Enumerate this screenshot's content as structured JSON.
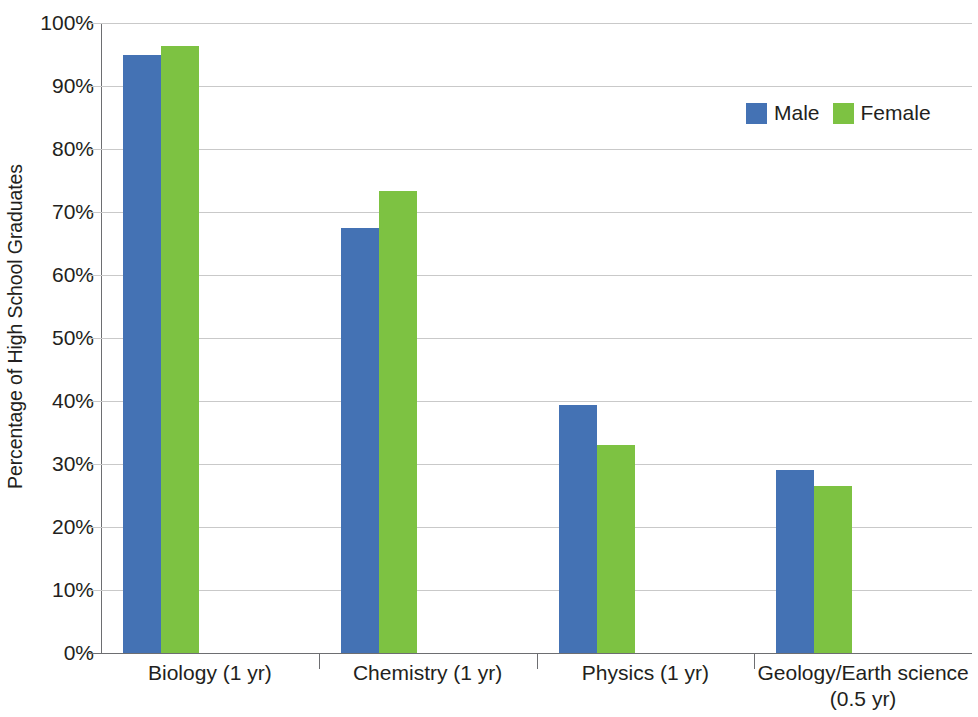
{
  "chart_data": {
    "type": "bar",
    "title": "",
    "subtitle": "",
    "xlabel": "",
    "ylabel": "Percentage of High School Graduates",
    "ylim": [
      0,
      100
    ],
    "ytick_values": [
      0,
      10,
      20,
      30,
      40,
      50,
      60,
      70,
      80,
      90,
      100
    ],
    "ytick_labels": [
      "0%",
      "10%",
      "20%",
      "30%",
      "40%",
      "50%",
      "60%",
      "70%",
      "80%",
      "90%",
      "100%"
    ],
    "grid": true,
    "legend_position": "top-right",
    "categories": [
      "Biology (1 yr)",
      "Chemistry (1 yr)",
      "Physics (1 yr)",
      "Geology/Earth science (0.5 yr)"
    ],
    "category_lines": [
      [
        "Biology (1 yr)"
      ],
      [
        "Chemistry (1 yr)"
      ],
      [
        "Physics (1 yr)"
      ],
      [
        "Geology/Earth science",
        "(0.5 yr)"
      ]
    ],
    "series": [
      {
        "name": "Male",
        "color": "#4472b4",
        "values": [
          95.0,
          67.5,
          39.3,
          29.0
        ],
        "value_labels": [
          "95%",
          "67.5%",
          "39.3%",
          "29%"
        ]
      },
      {
        "name": "Female",
        "color": "#7dc242",
        "values": [
          96.3,
          73.4,
          33.0,
          26.5
        ],
        "value_labels": [
          "96.3%",
          "73.4%",
          "33%",
          "26.5%"
        ]
      }
    ]
  },
  "legend": {
    "entries": [
      {
        "label": "Male",
        "color": "#4472b4",
        "swatch_name": "legend-swatch-male"
      },
      {
        "label": "Female",
        "color": "#7dc242",
        "swatch_name": "legend-swatch-female"
      }
    ]
  },
  "axis": {
    "y_title": "Percentage of High School Graduates"
  },
  "colors": {
    "male": "#4472b4",
    "female": "#7dc242",
    "gridline": "#c9c9c9",
    "axis": "#6d6e71",
    "text": "#231f20",
    "background": "#ffffff"
  }
}
